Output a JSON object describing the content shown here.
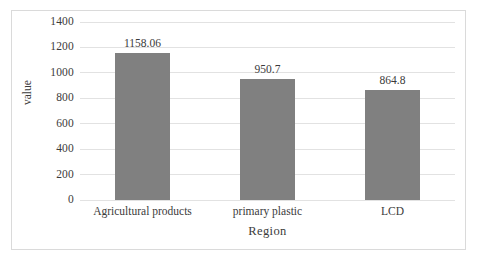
{
  "chart_data": {
    "type": "bar",
    "title": "",
    "subtitle": "",
    "xlabel": "Region",
    "ylabel": "value",
    "categories": [
      "Agricultural products",
      "primary plastic",
      "LCD"
    ],
    "values": [
      1158.06,
      950.7,
      864.8
    ],
    "data_labels": [
      "1158.06",
      "950.7",
      "864.8"
    ],
    "ylim": [
      0,
      1400
    ],
    "ytick_labels": [
      "0",
      "200",
      "400",
      "600",
      "800",
      "1000",
      "1200",
      "1400"
    ],
    "ytick_values": [
      0,
      200,
      400,
      600,
      800,
      1000,
      1200,
      1400
    ],
    "grid": true,
    "grid_axis": "y",
    "legend": false,
    "legend_position": "none",
    "series": [
      {
        "name": "value",
        "values": [
          1158.06,
          950.7,
          864.8
        ],
        "color": "#808080"
      }
    ],
    "colors": {
      "bar": "#808080",
      "gridline": "#e2e2e2",
      "text": "#3b3b3b",
      "frame": "#dadada",
      "background": "#ffffff"
    }
  }
}
